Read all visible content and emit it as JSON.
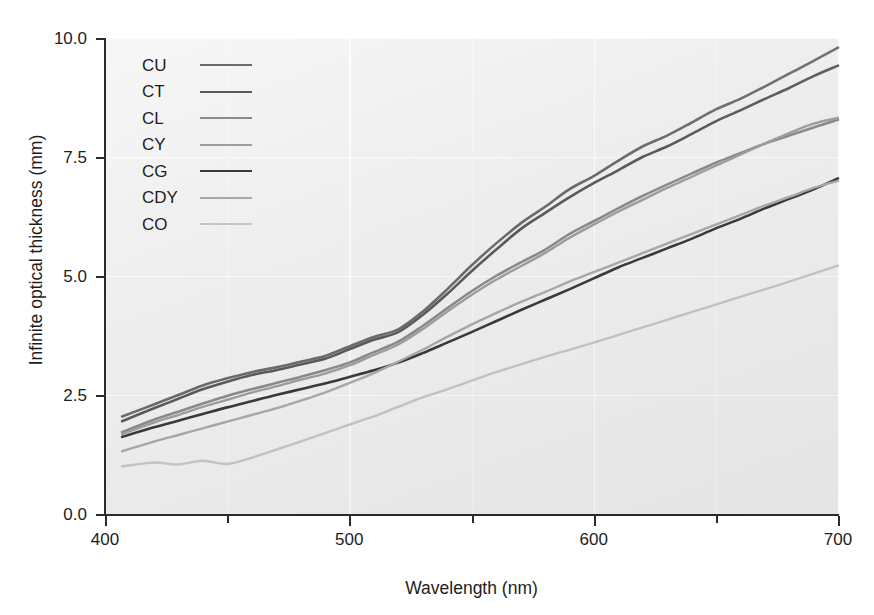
{
  "chart_data": {
    "type": "line",
    "title": "",
    "xlabel": "Wavelength (nm)",
    "ylabel": "Infinite optical thickness (mm)",
    "xlim": [
      400,
      700
    ],
    "ylim": [
      0.0,
      10.0
    ],
    "xticks": [
      400,
      500,
      600,
      700
    ],
    "xtick_labels": [
      "400",
      "500",
      "600",
      "700"
    ],
    "xminorticks": [
      450,
      550,
      650
    ],
    "yticks": [
      0.0,
      2.5,
      5.0,
      7.5,
      10.0
    ],
    "ytick_labels": [
      "0.0",
      "2.5",
      "5.0",
      "7.5",
      "10.0"
    ],
    "grid": true,
    "legend_position": "upper left",
    "x": [
      407,
      420,
      430,
      440,
      450,
      460,
      470,
      480,
      490,
      500,
      510,
      520,
      530,
      540,
      550,
      560,
      570,
      580,
      590,
      600,
      610,
      620,
      630,
      640,
      650,
      660,
      670,
      680,
      690,
      700
    ],
    "series": [
      {
        "name": "CU",
        "color": "#6b6b6b",
        "width": 2.6,
        "values": [
          2.05,
          2.3,
          2.5,
          2.7,
          2.85,
          2.98,
          3.08,
          3.2,
          3.32,
          3.52,
          3.72,
          3.88,
          4.25,
          4.72,
          5.22,
          5.68,
          6.1,
          6.45,
          6.82,
          7.1,
          7.42,
          7.72,
          7.95,
          8.22,
          8.5,
          8.72,
          8.98,
          9.25,
          9.52,
          9.8
        ]
      },
      {
        "name": "CT",
        "color": "#5a5a5a",
        "width": 2.6,
        "values": [
          1.95,
          2.22,
          2.42,
          2.62,
          2.78,
          2.92,
          3.02,
          3.14,
          3.26,
          3.46,
          3.66,
          3.82,
          4.18,
          4.62,
          5.1,
          5.55,
          5.98,
          6.32,
          6.65,
          6.95,
          7.22,
          7.5,
          7.72,
          7.98,
          8.25,
          8.48,
          8.72,
          8.95,
          9.2,
          9.42
        ]
      },
      {
        "name": "CL",
        "color": "#8a8a8a",
        "width": 2.6,
        "values": [
          1.72,
          1.98,
          2.15,
          2.32,
          2.48,
          2.62,
          2.75,
          2.88,
          3.02,
          3.18,
          3.4,
          3.62,
          3.95,
          4.32,
          4.68,
          5.0,
          5.28,
          5.55,
          5.88,
          6.15,
          6.42,
          6.68,
          6.92,
          7.15,
          7.38,
          7.58,
          7.78,
          7.95,
          8.12,
          8.28
        ]
      },
      {
        "name": "CY",
        "color": "#9d9d9d",
        "width": 2.4,
        "values": [
          1.68,
          1.92,
          2.08,
          2.25,
          2.4,
          2.55,
          2.68,
          2.82,
          2.95,
          3.12,
          3.34,
          3.56,
          3.88,
          4.25,
          4.6,
          4.92,
          5.2,
          5.48,
          5.8,
          6.08,
          6.35,
          6.6,
          6.85,
          7.08,
          7.32,
          7.55,
          7.78,
          8.0,
          8.2,
          8.32
        ]
      },
      {
        "name": "CG",
        "color": "#3a3a3a",
        "width": 2.6,
        "values": [
          1.62,
          1.82,
          1.96,
          2.1,
          2.24,
          2.37,
          2.5,
          2.62,
          2.74,
          2.88,
          3.02,
          3.18,
          3.38,
          3.6,
          3.82,
          4.05,
          4.28,
          4.5,
          4.72,
          4.95,
          5.18,
          5.38,
          5.58,
          5.78,
          6.0,
          6.2,
          6.42,
          6.62,
          6.82,
          7.05
        ]
      },
      {
        "name": "CDY",
        "color": "#a8a8a8",
        "width": 2.4,
        "values": [
          1.32,
          1.52,
          1.66,
          1.8,
          1.94,
          2.08,
          2.22,
          2.38,
          2.55,
          2.75,
          2.96,
          3.2,
          3.45,
          3.72,
          3.98,
          4.22,
          4.45,
          4.66,
          4.88,
          5.08,
          5.28,
          5.48,
          5.68,
          5.88,
          6.08,
          6.28,
          6.48,
          6.66,
          6.85,
          7.0
        ]
      },
      {
        "name": "CO",
        "color": "#c4c4c4",
        "width": 2.4,
        "values": [
          1.0,
          1.08,
          1.04,
          1.12,
          1.05,
          1.18,
          1.35,
          1.52,
          1.7,
          1.88,
          2.05,
          2.25,
          2.45,
          2.62,
          2.8,
          2.98,
          3.14,
          3.3,
          3.45,
          3.6,
          3.76,
          3.92,
          4.08,
          4.24,
          4.4,
          4.56,
          4.72,
          4.88,
          5.05,
          5.22
        ]
      }
    ],
    "legend": [
      {
        "label": "CU",
        "color": "#6b6b6b"
      },
      {
        "label": "CT",
        "color": "#5a5a5a"
      },
      {
        "label": "CL",
        "color": "#8a8a8a"
      },
      {
        "label": "CY",
        "color": "#9d9d9d"
      },
      {
        "label": "CG",
        "color": "#3a3a3a"
      },
      {
        "label": "CDY",
        "color": "#a8a8a8"
      },
      {
        "label": "CO",
        "color": "#c4c4c4"
      }
    ]
  }
}
